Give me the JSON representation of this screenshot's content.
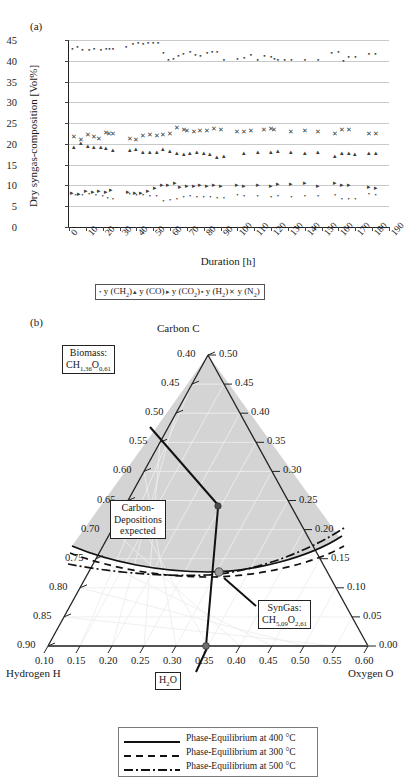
{
  "panel_a": {
    "letter": "(a)",
    "ylabel": "Dry syngas-composition [Vol%]",
    "xlabel": "Duration [h]",
    "yticks": [
      0,
      5,
      10,
      15,
      20,
      25,
      30,
      35,
      40,
      45
    ],
    "xticks": [
      0,
      10,
      20,
      30,
      40,
      50,
      60,
      70,
      80,
      90,
      100,
      110,
      120,
      130,
      140,
      150,
      160,
      170,
      180,
      190
    ],
    "legend": [
      {
        "marker": "•",
        "label": "y (CH",
        "sub": "2",
        "tail": ")"
      },
      {
        "marker": "▴",
        "label": "y (CO",
        "sub": "",
        "tail": ")"
      },
      {
        "marker": "▸",
        "label": "y (CO",
        "sub": "2",
        "tail": ")"
      },
      {
        "marker": "▪",
        "label": "y (H",
        "sub": "2",
        "tail": ")"
      },
      {
        "marker": "✕",
        "label": "y (N",
        "sub": "2",
        "tail": ")"
      }
    ]
  },
  "panel_b": {
    "letter": "(b)",
    "apex_label": "Carbon C",
    "left_label": "Hydrogen H",
    "right_label": "Oxygen O",
    "left_ticks": [
      "0.40",
      "0.45",
      "0.50",
      "0.55",
      "0.60",
      "0.65",
      "0.70",
      "0.75",
      "0.80",
      "0.85",
      "0.90"
    ],
    "right_ticks": [
      "0.50",
      "0.45",
      "0.40",
      "0.35",
      "0.30",
      "0.25",
      "0.20",
      "0.15",
      "0.10",
      "0.05",
      "0.00"
    ],
    "bottom_ticks": [
      "0.10",
      "0.15",
      "0.20",
      "0.25",
      "0.30",
      "0.35",
      "0.40",
      "0.45",
      "0.50",
      "0.55",
      "0.60"
    ],
    "callouts": [
      {
        "name": "biomass",
        "line1": "Biomass:",
        "line2": "CH",
        "sub2": "1,36",
        "mid": "O",
        "sub3": "0,61"
      },
      {
        "name": "carbon-deposition",
        "line1": "Carbon-",
        "line2": "Depositions",
        "line3": "expected"
      },
      {
        "name": "syngas",
        "line1": "SynGas:",
        "line2": "CH",
        "sub2": "5,09",
        "mid": "O",
        "sub3": "2,61"
      },
      {
        "name": "water",
        "line1": "H",
        "sub2": "2",
        "mid": "O"
      }
    ],
    "legend": [
      {
        "style": "solid",
        "label": "Phase-Equilibrium at 400 °C"
      },
      {
        "style": "dashed",
        "label": "Phase-Equilibrium at 300 °C"
      },
      {
        "style": "dashdot",
        "label": "Phase-Equilibrium at 500 °C"
      }
    ]
  },
  "chart_data": [
    {
      "type": "scatter",
      "title": "Dry syngas composition over duration",
      "xlabel": "Duration [h]",
      "ylabel": "Dry syngas-composition [Vol%]",
      "xlim": [
        0,
        190
      ],
      "ylim": [
        0,
        45
      ],
      "xticks": [
        0,
        10,
        20,
        30,
        40,
        50,
        60,
        70,
        80,
        90,
        100,
        110,
        120,
        130,
        140,
        150,
        160,
        170,
        180,
        190
      ],
      "yticks": [
        0,
        5,
        10,
        15,
        20,
        25,
        30,
        35,
        40,
        45
      ],
      "grid": "horizontal",
      "legend_position": "below-axis",
      "series": [
        {
          "name": "y (H2)",
          "marker": "square",
          "x": [
            2,
            5,
            8,
            12,
            15,
            19,
            22,
            24,
            26,
            34,
            38,
            41,
            44,
            47,
            50,
            53,
            56,
            59,
            62,
            65,
            68,
            72,
            75,
            78,
            82,
            85,
            88,
            92,
            100,
            104,
            108,
            112,
            116,
            120,
            122,
            124,
            128,
            132,
            140,
            148,
            156,
            160,
            163,
            166,
            170,
            178,
            182
          ],
          "y": [
            42.9,
            43.4,
            42.7,
            42.6,
            42.9,
            42.6,
            42.8,
            42.9,
            42.9,
            43.2,
            44.1,
            44.2,
            44.1,
            44.2,
            44.2,
            44.2,
            41.9,
            40.3,
            40.4,
            41.2,
            41.6,
            42.1,
            41.5,
            41.2,
            41.9,
            42.2,
            42.2,
            40.1,
            40.4,
            40.6,
            41.4,
            40.3,
            41.1,
            40.9,
            40.5,
            40.1,
            40.2,
            40.2,
            40.2,
            40.2,
            41.9,
            42.2,
            40.0,
            41.0,
            41.0,
            41.6,
            41.7
          ]
        },
        {
          "name": "y (N2)",
          "marker": "cross",
          "x": [
            3,
            7,
            11,
            15,
            18,
            22,
            24,
            26,
            36,
            40,
            44,
            48,
            52,
            56,
            60,
            64,
            68,
            70,
            74,
            78,
            82,
            86,
            90,
            100,
            104,
            108,
            116,
            120,
            122,
            132,
            140,
            148,
            158,
            162,
            166,
            178,
            182
          ],
          "y": [
            21.6,
            21.0,
            22.1,
            21.6,
            21.2,
            22.6,
            22.5,
            22.3,
            21.2,
            20.9,
            21.8,
            22.2,
            22.0,
            22.1,
            22.4,
            23.9,
            23.4,
            23.1,
            22.9,
            23.0,
            23.2,
            23.5,
            23.4,
            22.9,
            22.8,
            23.1,
            23.4,
            23.5,
            23.3,
            22.9,
            23.0,
            22.9,
            22.3,
            23.3,
            23.4,
            22.4,
            22.5
          ]
        },
        {
          "name": "y (CO)",
          "marker": "triangle-up",
          "x": [
            3,
            7,
            11,
            15,
            19,
            22,
            26,
            36,
            40,
            44,
            48,
            52,
            56,
            60,
            64,
            68,
            72,
            76,
            80,
            84,
            88,
            92,
            104,
            112,
            120,
            124,
            132,
            140,
            148,
            158,
            162,
            166,
            170,
            178,
            182
          ],
          "y": [
            19.3,
            20.2,
            19.5,
            19.2,
            19.3,
            18.9,
            18.5,
            18.5,
            18.8,
            18.1,
            18.0,
            18.0,
            18.7,
            18.2,
            17.7,
            17.5,
            17.8,
            18.1,
            17.8,
            17.5,
            16.8,
            17.0,
            17.9,
            18.0,
            18.0,
            18.3,
            18.0,
            17.9,
            18.1,
            17.0,
            17.9,
            17.7,
            17.6,
            17.7,
            17.9
          ]
        },
        {
          "name": "y (CO2)",
          "marker": "triangle-right",
          "x": [
            2,
            6,
            10,
            14,
            18,
            22,
            25,
            35,
            39,
            43,
            47,
            51,
            55,
            59,
            63,
            66,
            70,
            74,
            78,
            82,
            86,
            90,
            100,
            104,
            112,
            120,
            124,
            132,
            140,
            148,
            158,
            162,
            166,
            178,
            182
          ],
          "y": [
            8.3,
            7.9,
            8.6,
            8.4,
            8.6,
            8.5,
            8.9,
            8.4,
            8.2,
            8.3,
            8.7,
            9.4,
            10.0,
            10.2,
            10.6,
            9.6,
            9.8,
            9.9,
            10.0,
            9.9,
            10.0,
            9.9,
            10.0,
            9.8,
            10.0,
            9.9,
            10.4,
            10.4,
            10.5,
            9.9,
            10.6,
            10.1,
            10.1,
            9.6,
            9.4
          ]
        },
        {
          "name": "y (CH2)",
          "marker": "dot",
          "x": [
            4,
            8,
            12,
            16,
            20,
            23,
            26,
            36,
            40,
            44,
            48,
            52,
            56,
            60,
            64,
            68,
            72,
            76,
            80,
            84,
            88,
            92,
            100,
            104,
            112,
            120,
            124,
            132,
            140,
            148,
            158,
            162,
            166,
            170,
            178,
            182
          ],
          "y": [
            7.8,
            7.6,
            8.0,
            7.6,
            7.5,
            6.9,
            6.7,
            7.9,
            7.6,
            7.6,
            7.5,
            7.4,
            6.2,
            6.4,
            6.8,
            7.3,
            7.5,
            7.2,
            7.3,
            7.2,
            6.9,
            7.0,
            7.6,
            7.5,
            7.4,
            7.3,
            7.5,
            7.3,
            7.4,
            7.4,
            7.7,
            6.8,
            6.7,
            6.8,
            8.0,
            7.6
          ]
        }
      ]
    },
    {
      "type": "ternary",
      "title": "C-H-O ternary phase-equilibrium diagram",
      "axes": {
        "apex": "Carbon C",
        "left": "Hydrogen H",
        "right": "Oxygen O",
        "left_range": [
          0.4,
          0.9
        ],
        "right_range": [
          0.0,
          0.5
        ],
        "bottom_range": [
          0.1,
          0.6
        ]
      },
      "points": [
        {
          "label": "Biomass: CH1,36O0,61",
          "C": 0.34,
          "H": 0.47,
          "O": 0.19
        },
        {
          "label": "SynGas: CH5,09O2,61",
          "C": 0.115,
          "H": 0.66,
          "O": 0.225
        },
        {
          "label": "H2O",
          "C": 0.0,
          "H": 0.665,
          "O": 0.335
        }
      ],
      "curves": [
        {
          "name": "Phase-Equilibrium at 400 °C",
          "style": "solid"
        },
        {
          "name": "Phase-Equilibrium at 300 °C",
          "style": "dashed"
        },
        {
          "name": "Phase-Equilibrium at 500 °C",
          "style": "dashdot"
        }
      ],
      "shaded_region": "Carbon-Depositions expected"
    }
  ]
}
